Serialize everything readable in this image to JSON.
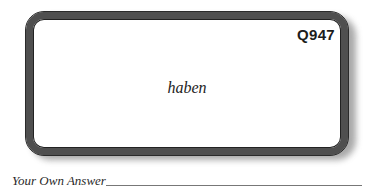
{
  "card": {
    "id": "Q947",
    "term": "haben"
  },
  "answer": {
    "label": "Your Own Answer",
    "value": ""
  },
  "colors": {
    "border": "#4f4f4f",
    "shadow": "#9a9a9a",
    "text": "#1c1c1c"
  }
}
